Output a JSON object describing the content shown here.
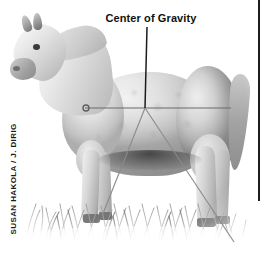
{
  "figure": {
    "annotation_label": "Center of Gravity",
    "credit": "SUSAN HAKOLA / J. DIRIG",
    "colors": {
      "label_text": "#111111",
      "credit_text": "#1a1a1a",
      "leader_line": "#1c1c1c",
      "balance_line": "#6b6b6b",
      "rule": "#1c1c1c",
      "background": "#ffffff"
    }
  },
  "annotations": {
    "center_of_gravity_point": {
      "x": 145,
      "y": 108
    },
    "leader_line": {
      "x1": 147,
      "y1": 27,
      "x2": 145,
      "y2": 108
    },
    "horizontal_balance_line": {
      "x1": 85,
      "y1": 108,
      "x2": 231,
      "y2": 108
    },
    "left_marker_circle": {
      "cx": 86,
      "cy": 108,
      "r": 3
    },
    "diagonal_front": {
      "x1": 145,
      "y1": 108,
      "x2": 102,
      "y2": 216
    },
    "diagonal_rear": {
      "x1": 145,
      "y1": 108,
      "x2": 234,
      "y2": 242
    },
    "right_rule": {
      "x": 259,
      "y1": 0,
      "y2": 201
    }
  },
  "parts": {
    "head": "horse-head",
    "neck": "horse-neck",
    "torso": "horse-torso",
    "hindquarter": "horse-hindquarter",
    "tail": "horse-tail",
    "legs": [
      "fore-near",
      "fore-far",
      "hind-near",
      "hind-far"
    ],
    "ground": "grass"
  }
}
